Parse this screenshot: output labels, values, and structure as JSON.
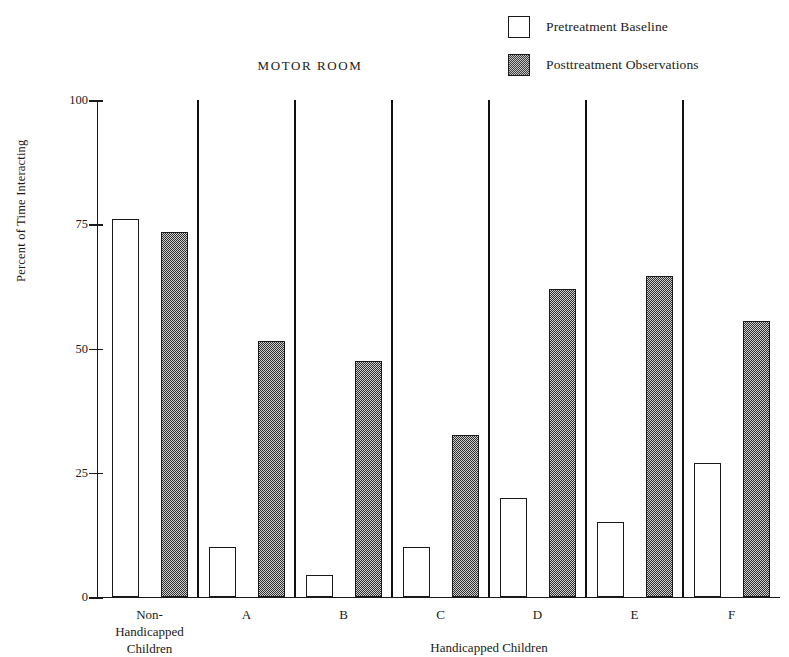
{
  "chart_data": {
    "type": "bar",
    "title": "MOTOR ROOM",
    "xlabel": "Handicapped Children",
    "ylabel": "Percent of Time Interacting",
    "ylim": [
      0,
      100
    ],
    "yticks": [
      0,
      25,
      50,
      75,
      100
    ],
    "ytick_labels": [
      "0",
      "25",
      "50",
      "75",
      "100"
    ],
    "grid": false,
    "legend_position": "top-right",
    "categories": [
      "Non-\nHandicapped\nChildren",
      "A",
      "B",
      "C",
      "D",
      "E",
      "F"
    ],
    "series": [
      {
        "name": "Pretreatment Baseline",
        "fill": "white",
        "values": [
          76,
          10,
          4.5,
          10,
          20,
          15,
          27
        ]
      },
      {
        "name": "Posttreatment Observations",
        "fill": "stipple-gray",
        "values": [
          73.5,
          51.5,
          47.5,
          32.5,
          62,
          64.5,
          55.5
        ]
      }
    ],
    "separators_after_group_index": [
      0,
      1,
      2,
      3,
      4,
      5
    ],
    "colors": {
      "axis": "#1a1a1a",
      "pretreatment": "#ffffff",
      "posttreatment": "#8d8d8d",
      "text": "#1a1a1a",
      "background": "#ffffff"
    }
  },
  "legend": {
    "items": [
      {
        "label": "Pretreatment Baseline",
        "swatch": "white-square"
      },
      {
        "label": "Posttreatment Observations",
        "swatch": "stippled-square"
      }
    ]
  }
}
